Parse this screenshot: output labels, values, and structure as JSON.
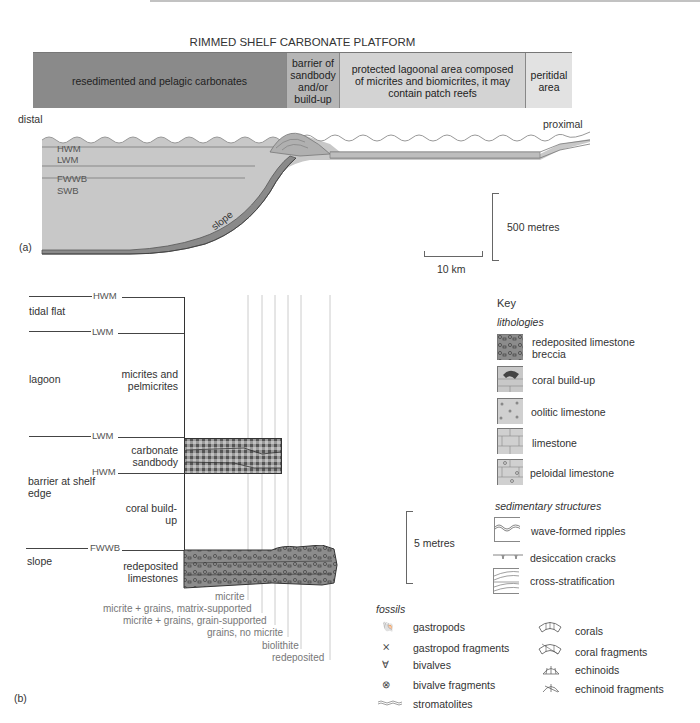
{
  "header": {
    "title": "RIMMED SHELF CARBONATE PLATFORM",
    "cells": [
      {
        "label": "resedimented and pelagic carbonates",
        "color": "#8a8a8a"
      },
      {
        "label": "barrier of sandbody and/or build-up",
        "color": "#b5b5b5"
      },
      {
        "label": "protected lagoonal area composed of micrites and biomicrites, it may contain patch reefs",
        "color": "#d3d3d3"
      },
      {
        "label": "peritidal area",
        "color": "#e2e2e2"
      }
    ]
  },
  "panel_a": {
    "label": "(a)",
    "distal": "distal",
    "proximal": "proximal",
    "levels": [
      "HWM",
      "LWM",
      "FWWB",
      "SWB"
    ],
    "slope_label": "slope",
    "scale_vertical": "500 metres",
    "scale_horizontal": "10 km"
  },
  "panel_b": {
    "label": "(b)",
    "environments": [
      {
        "name": "tidal flat",
        "upper": "HWM"
      },
      {
        "name": "lagoon",
        "upper": "LWM"
      },
      {
        "name": "barrier at shelf edge",
        "upper": "LWM",
        "lower": "HWM"
      },
      {
        "name": "slope",
        "upper": "FWWB"
      }
    ],
    "facies": [
      {
        "name": "micrites and pelmicrites"
      },
      {
        "name": "carbonate sandbody"
      },
      {
        "name": "coral build-up"
      },
      {
        "name": "redeposited limestones"
      }
    ],
    "scale": "5 metres",
    "texture_axis": [
      "micrite",
      "micrite + grains, matrix-supported",
      "micrite + grains, grain-supported",
      "grains, no micrite",
      "biolithite",
      "redeposited"
    ]
  },
  "key": {
    "title": "Key",
    "lithologies_heading": "lithologies",
    "lithologies": [
      {
        "label": "redeposited limestone breccia",
        "icon": "breccia-swatch"
      },
      {
        "label": "coral build-up",
        "icon": "coral-buildup-swatch"
      },
      {
        "label": "oolitic limestone",
        "icon": "oolitic-swatch"
      },
      {
        "label": "limestone",
        "icon": "limestone-swatch"
      },
      {
        "label": "peloidal limestone",
        "icon": "peloidal-swatch"
      }
    ],
    "structures_heading": "sedimentary structures",
    "structures": [
      {
        "label": "wave-formed ripples",
        "icon": "ripples-icon"
      },
      {
        "label": "desiccation cracks",
        "icon": "desiccation-cracks-icon"
      },
      {
        "label": "cross-stratification",
        "icon": "cross-stratification-icon"
      }
    ],
    "fossils_heading": "fossils",
    "fossils_left": [
      {
        "label": "gastropods",
        "icon": "gastropod-icon"
      },
      {
        "label": "gastropod fragments",
        "icon": "gastropod-fragment-icon"
      },
      {
        "label": "bivalves",
        "icon": "bivalve-icon"
      },
      {
        "label": "bivalve fragments",
        "icon": "bivalve-fragment-icon"
      },
      {
        "label": "stromatolites",
        "icon": "stromatolite-icon"
      }
    ],
    "fossils_right": [
      {
        "label": "corals",
        "icon": "coral-icon"
      },
      {
        "label": "coral fragments",
        "icon": "coral-fragment-icon"
      },
      {
        "label": "echinoids",
        "icon": "echinoid-icon"
      },
      {
        "label": "echinoid fragments",
        "icon": "echinoid-fragment-icon"
      }
    ]
  }
}
